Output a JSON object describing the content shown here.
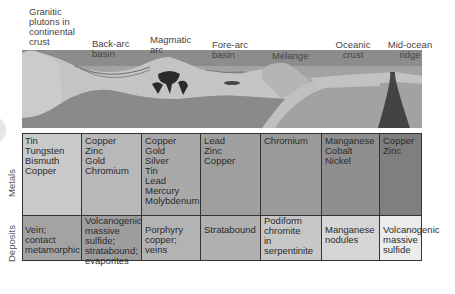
{
  "zones": [
    {
      "id": "granitic",
      "label": "Granitic\nplutons in\ncontinental\ncrust"
    },
    {
      "id": "backarc",
      "label": "Back-arc\nbasin"
    },
    {
      "id": "magmatic",
      "label": "Magmatic\narc"
    },
    {
      "id": "forearc",
      "label": "Fore-arc\nbasin"
    },
    {
      "id": "melange",
      "label": "Mélange"
    },
    {
      "id": "oceanic",
      "label": "Oceanic\ncrust"
    },
    {
      "id": "ridge",
      "label": "Mid-ocean\nridge"
    }
  ],
  "row_labels": {
    "metals": "Metals",
    "deposits": "Deposits"
  },
  "metals": [
    "Tin\nTungsten\nBismuth\nCopper",
    "Copper\nZinc\nGold\nChromium",
    "Copper\nGold\nSilver\nTin\nLead\nMercury\nMolybdenum",
    "Lead\nZinc\nCopper",
    "Chromium",
    "Manganese\nCobalt\nNickel",
    "Copper\nZinc"
  ],
  "deposits": [
    "Vein;\ncontact\nmetamorphic",
    "Volcanogenic\nmassive\nsulfide;\nstratabound;\nevaporites",
    "Porphyry\n    copper;\nveins",
    "Stratabound",
    "Podiform\nchromite\nin\nserpentinite",
    "Manganese\nnodules",
    "Volcanogenic\nmassive\nsulfide"
  ],
  "colors": {
    "metals": [
      "#c9c9c9",
      "#b8b8b8",
      "#a9a9a9",
      "#9f9f9f",
      "#9a9a9a",
      "#8f8f8f",
      "#7f7f7f"
    ],
    "deposits": [
      "#a3a3a3",
      "#9d9d9d",
      "#b3b3b3",
      "#b0b0b0",
      "#c7c7c7",
      "#d6d6d6",
      "#ececec"
    ]
  }
}
